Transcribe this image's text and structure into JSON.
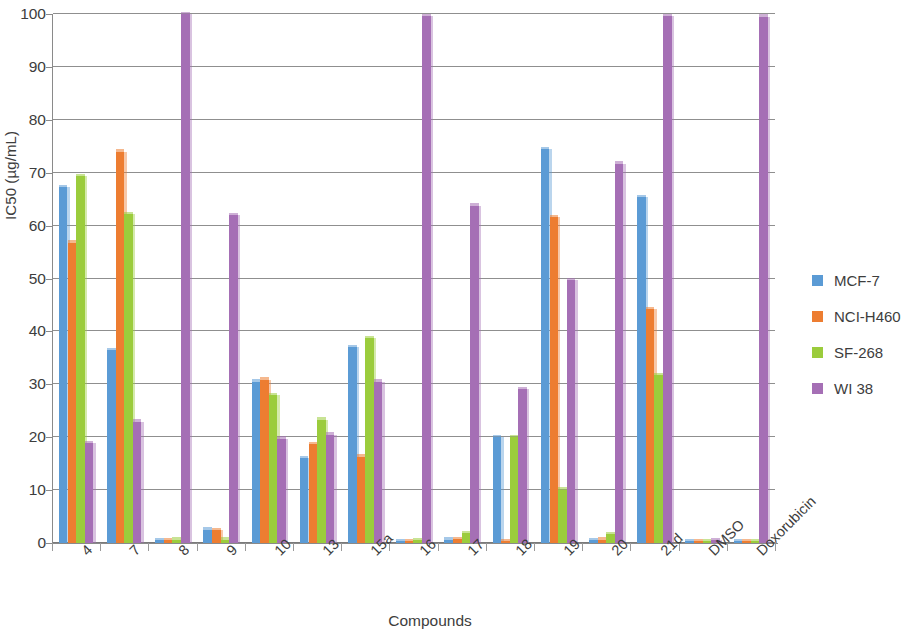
{
  "chart_data": {
    "type": "bar",
    "title": "",
    "xlabel": "Compounds",
    "ylabel": "IC50 (µg/mL)",
    "ylim": [
      0,
      100
    ],
    "yticks": [
      0,
      10,
      20,
      30,
      40,
      50,
      60,
      70,
      80,
      90,
      100
    ],
    "grid": true,
    "legend_position": "right",
    "categories": [
      "4",
      "7",
      "8",
      "9",
      "10",
      "13",
      "15a",
      "16",
      "17",
      "18",
      "19",
      "20",
      "21d",
      "DMSO",
      "Doxorubicin"
    ],
    "series": [
      {
        "name": "MCF-7",
        "color": "#5B9BD5",
        "values": [
          67.3,
          36.5,
          0.5,
          2.5,
          30.5,
          16.0,
          37.0,
          0.4,
          0.6,
          20.0,
          74.5,
          0.5,
          65.4,
          0.4,
          0.4
        ]
      },
      {
        "name": "NCI-H460",
        "color": "#ED7D31",
        "values": [
          56.8,
          74.0,
          0.5,
          2.4,
          30.9,
          18.7,
          16.3,
          0.4,
          0.7,
          0.4,
          61.6,
          0.6,
          44.2,
          0.4,
          0.4
        ]
      },
      {
        "name": "SF-268",
        "color": "#9BCC3C",
        "values": [
          69.3,
          62.2,
          0.6,
          0.6,
          28.0,
          23.3,
          38.7,
          0.5,
          1.8,
          20.0,
          10.1,
          1.7,
          31.7,
          0.4,
          0.4
        ]
      },
      {
        "name": "WI 38",
        "color": "#A56FB5",
        "values": [
          18.9,
          22.9,
          100.0,
          62.0,
          19.7,
          20.5,
          30.5,
          99.6,
          63.8,
          29.1,
          49.7,
          71.7,
          99.6,
          0.5,
          99.5
        ]
      }
    ]
  },
  "legend": {
    "items": [
      {
        "label": "MCF-7",
        "color": "#5B9BD5"
      },
      {
        "label": "NCI-H460",
        "color": "#ED7D31"
      },
      {
        "label": "SF-268",
        "color": "#9BCC3C"
      },
      {
        "label": "WI 38",
        "color": "#A56FB5"
      }
    ]
  }
}
